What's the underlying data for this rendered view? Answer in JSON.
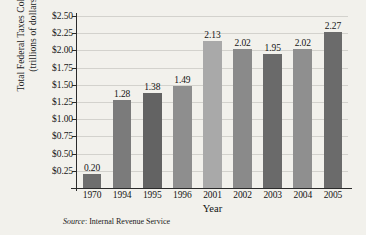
{
  "chart_data": {
    "type": "bar",
    "title": "",
    "xlabel": "Year",
    "ylabel_line1": "Total Federal Taxes Collected",
    "ylabel_line2": "(trillions of dollars)",
    "categories": [
      "1970",
      "1994",
      "1995",
      "1996",
      "2001",
      "2002",
      "2003",
      "2004",
      "2005"
    ],
    "values": [
      0.2,
      1.28,
      1.38,
      1.49,
      2.13,
      2.02,
      1.95,
      2.02,
      2.27
    ],
    "value_labels": [
      "0.20",
      "1.28",
      "1.38",
      "1.49",
      "2.13",
      "2.02",
      "1.95",
      "2.02",
      "2.27"
    ],
    "bar_colors": [
      "#6e6e6e",
      "#7b7b7b",
      "#636363",
      "#8e8e8e",
      "#a9a9a9",
      "#8a8a8a",
      "#6a6a6a",
      "#8f8f8f",
      "#6b6b6b"
    ],
    "ylim": [
      0,
      2.5
    ],
    "ytick_values": [
      0.25,
      0.5,
      0.75,
      1.0,
      1.25,
      1.5,
      1.75,
      2.0,
      2.25,
      2.5
    ],
    "ytick_labels": [
      "$0.25",
      "$0.50",
      "$0.75",
      "$1.00",
      "$1.25",
      "$1.50",
      "$1.75",
      "$2.00",
      "$2.25",
      "$2.50"
    ],
    "grid": true,
    "legend": "none"
  },
  "caption": {
    "source_word": "Source",
    "source_text": ": Internal Revenue Service"
  }
}
